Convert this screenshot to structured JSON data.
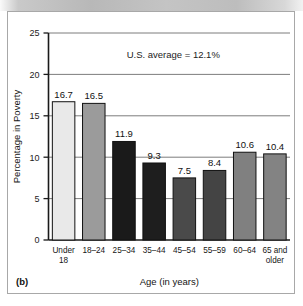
{
  "figure": {
    "panel_tag": "(b)"
  },
  "chart_data": {
    "type": "bar",
    "title": "",
    "xlabel": "Age (in years)",
    "ylabel": "Percentage in Poverty",
    "categories": [
      "Under 18",
      "18–24",
      "25–34",
      "35–44",
      "45–54",
      "55–59",
      "60–64",
      "65 and older"
    ],
    "category_lines": [
      [
        "Under",
        "18"
      ],
      [
        "18–24",
        ""
      ],
      [
        "25–34",
        ""
      ],
      [
        "35–44",
        ""
      ],
      [
        "45–54",
        ""
      ],
      [
        "55–59",
        ""
      ],
      [
        "60–64",
        ""
      ],
      [
        "65 and",
        "older"
      ]
    ],
    "values": [
      16.7,
      16.5,
      11.9,
      9.3,
      7.5,
      8.4,
      10.6,
      10.4
    ],
    "value_labels": [
      "16.7",
      "16.5",
      "11.9",
      "9.3",
      "7.5",
      "8.4",
      "10.6",
      "10.4"
    ],
    "bar_colors": [
      "#e9e9e9",
      "#9b9b9b",
      "#1a1a1a",
      "#1e1e1e",
      "#4a4a4a",
      "#444444",
      "#808080",
      "#838383"
    ],
    "ylim": [
      0,
      25
    ],
    "yticks": [
      0,
      5,
      10,
      15,
      20,
      25
    ],
    "ytick_labels": [
      "0",
      "5",
      "10",
      "15",
      "20",
      "25"
    ],
    "grid": true,
    "legend": "none",
    "annotations": [
      {
        "text": "U.S. average = 12.1%",
        "value": 12.1
      }
    ]
  }
}
